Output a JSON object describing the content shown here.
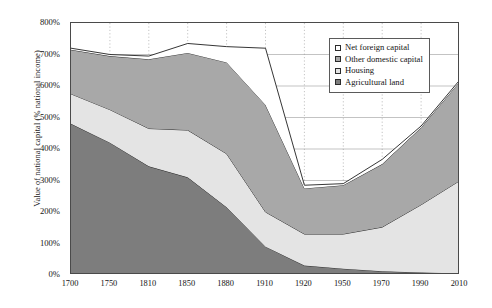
{
  "chart_data": {
    "type": "area",
    "stacked": true,
    "title": "",
    "xlabel": "",
    "ylabel": "Value of national capital (% national income)",
    "categories": [
      "1700",
      "1750",
      "1810",
      "1850",
      "1880",
      "1910",
      "1920",
      "1950",
      "1970",
      "1990",
      "2010"
    ],
    "x_tick_labels": [
      "1700",
      "1750",
      "1810",
      "1850",
      "1880",
      "1910",
      "1920",
      "1950",
      "1970",
      "1990",
      "2010"
    ],
    "y_tick_labels": [
      "0%",
      "100%",
      "200%",
      "300%",
      "400%",
      "500%",
      "600%",
      "700%",
      "800%"
    ],
    "y_tick_values": [
      0,
      100,
      200,
      300,
      400,
      500,
      600,
      700,
      800
    ],
    "ylim": [
      0,
      800
    ],
    "y_unit": "%",
    "grid": "vertical-dotted-and-horizontal-solid",
    "legend_position": "top-right-inside",
    "series": [
      {
        "name": "Agricultural land",
        "color": "#7d7d7d",
        "values": [
          480,
          420,
          345,
          310,
          215,
          90,
          30,
          20,
          12,
          8,
          5
        ]
      },
      {
        "name": "Housing",
        "color": "#e4e4e4",
        "values": [
          95,
          105,
          120,
          150,
          170,
          110,
          100,
          110,
          140,
          215,
          295
        ]
      },
      {
        "name": "Other domestic capital",
        "color": "#a8a8a8",
        "values": [
          140,
          170,
          220,
          245,
          290,
          340,
          145,
          155,
          200,
          245,
          315
        ]
      },
      {
        "name": "Net foreign capital",
        "color": "#ffffff",
        "values": [
          5,
          5,
          10,
          30,
          50,
          180,
          10,
          5,
          15,
          5,
          5
        ]
      }
    ],
    "cumulative_totals": [
      720,
      700,
      695,
      735,
      725,
      720,
      285,
      290,
      367,
      473,
      620
    ]
  },
  "legend": {
    "items": [
      {
        "label": "Net foreign capital",
        "swatch": "#ffffff"
      },
      {
        "label": "Other domestic capital",
        "swatch": "#a8a8a8"
      },
      {
        "label": "Housing",
        "swatch": "#e4e4e4"
      },
      {
        "label": "Agricultural land",
        "swatch": "#7d7d7d"
      }
    ]
  },
  "axis": {
    "y_title": "Value of national capital (% national income)"
  },
  "colors": {
    "frame": "#4a4a4a",
    "gridline": "#9a9a9a",
    "series_outline": "#1f1f1f",
    "background": "#ffffff"
  }
}
